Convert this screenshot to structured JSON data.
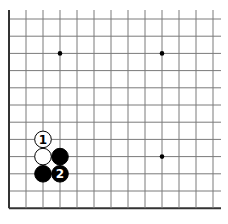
{
  "diagram": {
    "type": "go-board-fragment",
    "grid": {
      "origin_x": 9,
      "origin_y": 19,
      "spacing_x": 17.0,
      "spacing_y": 17.2,
      "cols": 13,
      "rows": 12,
      "top_extend": 9,
      "right_extend": 8,
      "line_color": "#7a7a7a",
      "edge_color": "#333333",
      "edges": {
        "left": true,
        "bottom": true,
        "top": false,
        "right": false
      }
    },
    "star_points": [
      {
        "col": 3,
        "row": 2
      },
      {
        "col": 9,
        "row": 2
      },
      {
        "col": 9,
        "row": 8
      }
    ],
    "stones": [
      {
        "color": "white",
        "col": 2,
        "row": 7,
        "label": "1"
      },
      {
        "color": "white",
        "col": 2,
        "row": 8,
        "label": ""
      },
      {
        "color": "black",
        "col": 3,
        "row": 8,
        "label": ""
      },
      {
        "color": "black",
        "col": 2,
        "row": 9,
        "label": ""
      },
      {
        "color": "black",
        "col": 3,
        "row": 9,
        "label": "2"
      }
    ],
    "colors": {
      "black_stone": "#000000",
      "white_stone": "#ffffff",
      "stone_outline": "#000000",
      "background": "#ffffff"
    }
  }
}
